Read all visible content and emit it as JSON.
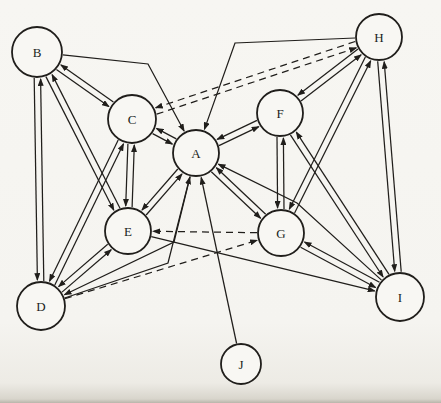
{
  "figure": {
    "name": "directed-sociogram"
  },
  "colors": {
    "ink": "#201e1b",
    "paper": "#f6f5f1",
    "node_fill": "#f8f7f3"
  },
  "graph": {
    "nodes": [
      {
        "id": "B",
        "label": "B",
        "x": 37,
        "y": 52,
        "r": 25
      },
      {
        "id": "H",
        "label": "H",
        "x": 379,
        "y": 37,
        "r": 23
      },
      {
        "id": "C",
        "label": "C",
        "x": 132,
        "y": 119,
        "r": 24
      },
      {
        "id": "F",
        "label": "F",
        "x": 280,
        "y": 113,
        "r": 23
      },
      {
        "id": "A",
        "label": "A",
        "x": 196,
        "y": 153,
        "r": 23
      },
      {
        "id": "E",
        "label": "E",
        "x": 128,
        "y": 231,
        "r": 23
      },
      {
        "id": "G",
        "label": "G",
        "x": 281,
        "y": 233,
        "r": 23
      },
      {
        "id": "D",
        "label": "D",
        "x": 41,
        "y": 306,
        "r": 24
      },
      {
        "id": "I",
        "label": "I",
        "x": 400,
        "y": 297,
        "r": 24
      },
      {
        "id": "J",
        "label": "J",
        "x": 241,
        "y": 364,
        "r": 20
      }
    ],
    "edges": [
      {
        "from": "B",
        "to": "C"
      },
      {
        "from": "C",
        "to": "B"
      },
      {
        "from": "B",
        "to": "D"
      },
      {
        "from": "D",
        "to": "B"
      },
      {
        "from": "B",
        "to": "E"
      },
      {
        "from": "E",
        "to": "B"
      },
      {
        "from": "A",
        "to": "C"
      },
      {
        "from": "C",
        "to": "A"
      },
      {
        "from": "A",
        "to": "E"
      },
      {
        "from": "E",
        "to": "A"
      },
      {
        "from": "A",
        "to": "F"
      },
      {
        "from": "F",
        "to": "A"
      },
      {
        "from": "A",
        "to": "G"
      },
      {
        "from": "G",
        "to": "A"
      },
      {
        "from": "C",
        "to": "E"
      },
      {
        "from": "E",
        "to": "C"
      },
      {
        "from": "C",
        "to": "D"
      },
      {
        "from": "D",
        "to": "C"
      },
      {
        "from": "D",
        "to": "E"
      },
      {
        "from": "E",
        "to": "D"
      },
      {
        "from": "F",
        "to": "G"
      },
      {
        "from": "G",
        "to": "F"
      },
      {
        "from": "F",
        "to": "H"
      },
      {
        "from": "H",
        "to": "F"
      },
      {
        "from": "F",
        "to": "I"
      },
      {
        "from": "I",
        "to": "F"
      },
      {
        "from": "G",
        "to": "H"
      },
      {
        "from": "H",
        "to": "G"
      },
      {
        "from": "G",
        "to": "I"
      },
      {
        "from": "I",
        "to": "G"
      },
      {
        "from": "H",
        "to": "I"
      },
      {
        "from": "I",
        "to": "H"
      },
      {
        "from": "B",
        "to": "A",
        "via": [
          [
            148,
            64
          ]
        ]
      },
      {
        "from": "H",
        "to": "A",
        "via": [
          [
            235,
            43
          ]
        ]
      },
      {
        "from": "A",
        "to": "D",
        "via": [
          [
            174,
            242
          ]
        ]
      },
      {
        "from": "D",
        "to": "A",
        "via": [
          [
            168,
            263
          ]
        ]
      },
      {
        "from": "E",
        "to": "I"
      },
      {
        "from": "I",
        "to": "A",
        "via": [
          [
            297,
            203
          ]
        ]
      },
      {
        "from": "J",
        "to": "A"
      },
      {
        "from": "C",
        "to": "H",
        "style": "dashed"
      },
      {
        "from": "H",
        "to": "C",
        "style": "dashed"
      },
      {
        "from": "G",
        "to": "E",
        "style": "dashed"
      },
      {
        "from": "D",
        "to": "G",
        "style": "dashed"
      }
    ]
  }
}
